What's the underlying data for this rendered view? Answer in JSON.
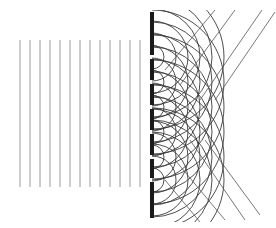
{
  "diagram": {
    "colors": {
      "background": "#ffffff",
      "incident_wave": "#9a9a9a",
      "barrier": "#1a1a1a",
      "arc": "#3a3a3a",
      "diffracted_ray": "#555555"
    },
    "incident_wavefronts": {
      "x": [
        20,
        30,
        40,
        50,
        60,
        70,
        80,
        90,
        100,
        110,
        120,
        130,
        140
      ],
      "y_top": 40,
      "y_bottom": 187
    },
    "barrier": {
      "x": 150,
      "width": 4,
      "y_top": 12,
      "y_bottom": 218,
      "slit_centers": [
        57,
        82,
        107,
        132,
        157,
        180
      ],
      "slit_height": 4
    },
    "arcs": {
      "radii": [
        12,
        24,
        36,
        48,
        60,
        72
      ],
      "clip_top": 10,
      "clip_bottom": 222
    },
    "diffracted_rays_up": [
      {
        "x1": 200,
        "y1": 100,
        "x2": 262,
        "y2": 10
      },
      {
        "x1": 215,
        "y1": 100,
        "x2": 275,
        "y2": 12
      },
      {
        "x1": 180,
        "y1": 85,
        "x2": 235,
        "y2": 10
      },
      {
        "x1": 165,
        "y1": 70,
        "x2": 215,
        "y2": 10
      }
    ],
    "diffracted_rays_down": [
      {
        "x1": 190,
        "y1": 140,
        "x2": 245,
        "y2": 220
      },
      {
        "x1": 205,
        "y1": 140,
        "x2": 260,
        "y2": 215
      },
      {
        "x1": 175,
        "y1": 160,
        "x2": 225,
        "y2": 220
      },
      {
        "x1": 165,
        "y1": 180,
        "x2": 200,
        "y2": 222
      }
    ]
  }
}
